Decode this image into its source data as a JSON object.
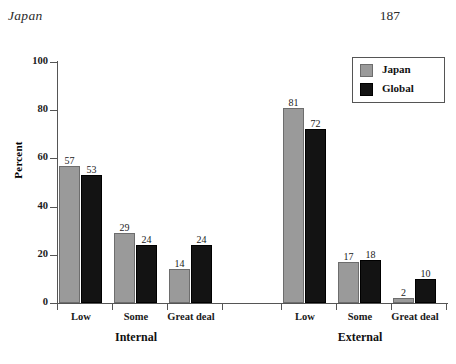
{
  "page": {
    "running_head": "Japan",
    "page_number": "187"
  },
  "chart_data": {
    "type": "bar",
    "title": "",
    "xlabel": "",
    "ylabel": "Percent",
    "ylim": [
      0,
      100
    ],
    "yticks": [
      0,
      20,
      40,
      60,
      80,
      100
    ],
    "ytick_labels": [
      "0",
      "20",
      "40",
      "60",
      "80",
      "100"
    ],
    "grid": false,
    "legend_position": "top-right",
    "groups": [
      "Internal",
      "External"
    ],
    "categories": [
      "Low",
      "Some",
      "Great deal",
      "Low",
      "Some",
      "Great deal"
    ],
    "series": [
      {
        "name": "Japan",
        "color": "#9a9a9a",
        "values": [
          57,
          29,
          14,
          81,
          17,
          2
        ]
      },
      {
        "name": "Global",
        "color": "#131313",
        "values": [
          53,
          24,
          24,
          72,
          18,
          10
        ]
      }
    ],
    "bars": [
      {
        "group": "Internal",
        "category": "Low",
        "japan": 57,
        "global": 53
      },
      {
        "group": "Internal",
        "category": "Some",
        "japan": 29,
        "global": 24
      },
      {
        "group": "Internal",
        "category": "Great deal",
        "japan": 14,
        "global": 24
      },
      {
        "group": "External",
        "category": "Low",
        "japan": 81,
        "global": 72
      },
      {
        "group": "External",
        "category": "Some",
        "japan": 17,
        "global": 18
      },
      {
        "group": "External",
        "category": "Great deal",
        "japan": 2,
        "global": 10
      }
    ],
    "data_labels": [
      "57",
      "53",
      "29",
      "24",
      "14",
      "24",
      "81",
      "72",
      "17",
      "18",
      "2",
      "10"
    ]
  },
  "legend": {
    "items": [
      {
        "label": "Japan",
        "color": "#9a9a9a"
      },
      {
        "label": "Global",
        "color": "#131313"
      }
    ]
  }
}
